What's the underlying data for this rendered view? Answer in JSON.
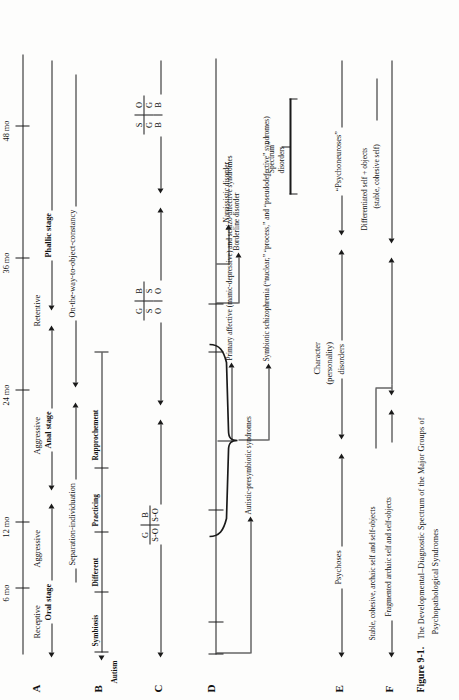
{
  "figure": {
    "number": "Figure 9-1.",
    "caption_line1": "The Developmental–Diagnostic Spectrum of the Major Groups of",
    "caption_line2": "Psychopathological  Syndromes",
    "caption_plain": "FIGURE 9-1. THE DEVELOPMENTAL–DIAGNOSTIC SPECTRUM OF THE MAJOR GROUPS OF PSYCHOPATHOLOGICAL SYNDROMES"
  },
  "axis": {
    "ticks": [
      "6 mo",
      "12 mo",
      "24 mo",
      "36 mo",
      "48 mo"
    ],
    "tick_months": [
      6,
      12,
      24,
      36,
      48
    ]
  },
  "rows": {
    "A": {
      "label": "A",
      "stages": [
        "Oral stage",
        "Anal stage",
        "Phallic stage"
      ],
      "qualifiers": [
        "Receptive",
        "Aggressive",
        "Aggressive",
        "Retentive"
      ]
    },
    "B": {
      "label": "B",
      "autism": "Autism",
      "phases": [
        "Symbiosis",
        "Different",
        "Practicing",
        "Rapprochement"
      ],
      "span1": "Separation-individuation",
      "span2": "On-the-way-to-object-constancy"
    },
    "C": {
      "label": "C",
      "cells": [
        {
          "top": [
            "G",
            "B"
          ],
          "mid": [
            "S-O",
            "S-O"
          ]
        },
        {
          "top": [
            "G",
            "B"
          ],
          "mid": [
            "S",
            "S"
          ],
          "bot": [
            "O",
            "O"
          ]
        },
        {
          "top": [
            "S",
            "O"
          ],
          "mid": [
            "G",
            "G"
          ],
          "bot": [
            "B",
            "B"
          ]
        }
      ]
    },
    "D": {
      "label": "D",
      "items": [
        "Autistic-presymbiotic syndromes",
        "Symbiotic schizophrenia (“reactive,” “process,” and “pseudodefective” syndromes)",
        "Primary affective (manic-depressive) and schizo-affective syndromes",
        "Borderline disorder",
        "Narcissistic disorder"
      ],
      "items_split": [
        {
          "l1": "Autistic-presymbiotic syndromes",
          "l2": ""
        },
        {
          "l1": "Symbiotic schizophrenia (“reactive,” “process,” and “pseudodefective” syndromes)",
          "l2": ""
        },
        {
          "l1": "Primary affective (manic-depressive) and paranoid syndromes",
          "l2": ""
        },
        {
          "l1": "Borderline disorder",
          "l2": ""
        },
        {
          "l1": "Narcissistic disorder",
          "l2": ""
        }
      ],
      "spectrum_bracket": {
        "line1": "“Spectrum”",
        "line2": "disorders"
      }
    },
    "E": {
      "label": "E",
      "groups": [
        "Psychoses",
        "Character",
        "(personality)",
        "disorders",
        "“Psychoneuroses”"
      ],
      "group1": "Psychoses",
      "group2_l1": "Character",
      "group2_l2": "(personality)",
      "group2_l3": "disorders",
      "group3": "“Psychoneuroses”"
    },
    "F": {
      "label": "F",
      "state1": "Fragmented archaic self and self-objects",
      "state2": "Stable, cohesive, archaic self and self-objects",
      "state3_l1": "Differentiated self + objects",
      "state3_l2": "(stable, cohesive self)"
    }
  },
  "schizophrenia_detail": {
    "line_a": "Symbiotic schizophrenia (“reactive,” and schizo-affective syndromes)",
    "full": "Symbiotic schizophrenia (“nuclear,” “process,” and “pseudodefective” syndromes)"
  },
  "colors": {
    "ink": "#1a1a1a",
    "paper": "#fdfdfc"
  }
}
